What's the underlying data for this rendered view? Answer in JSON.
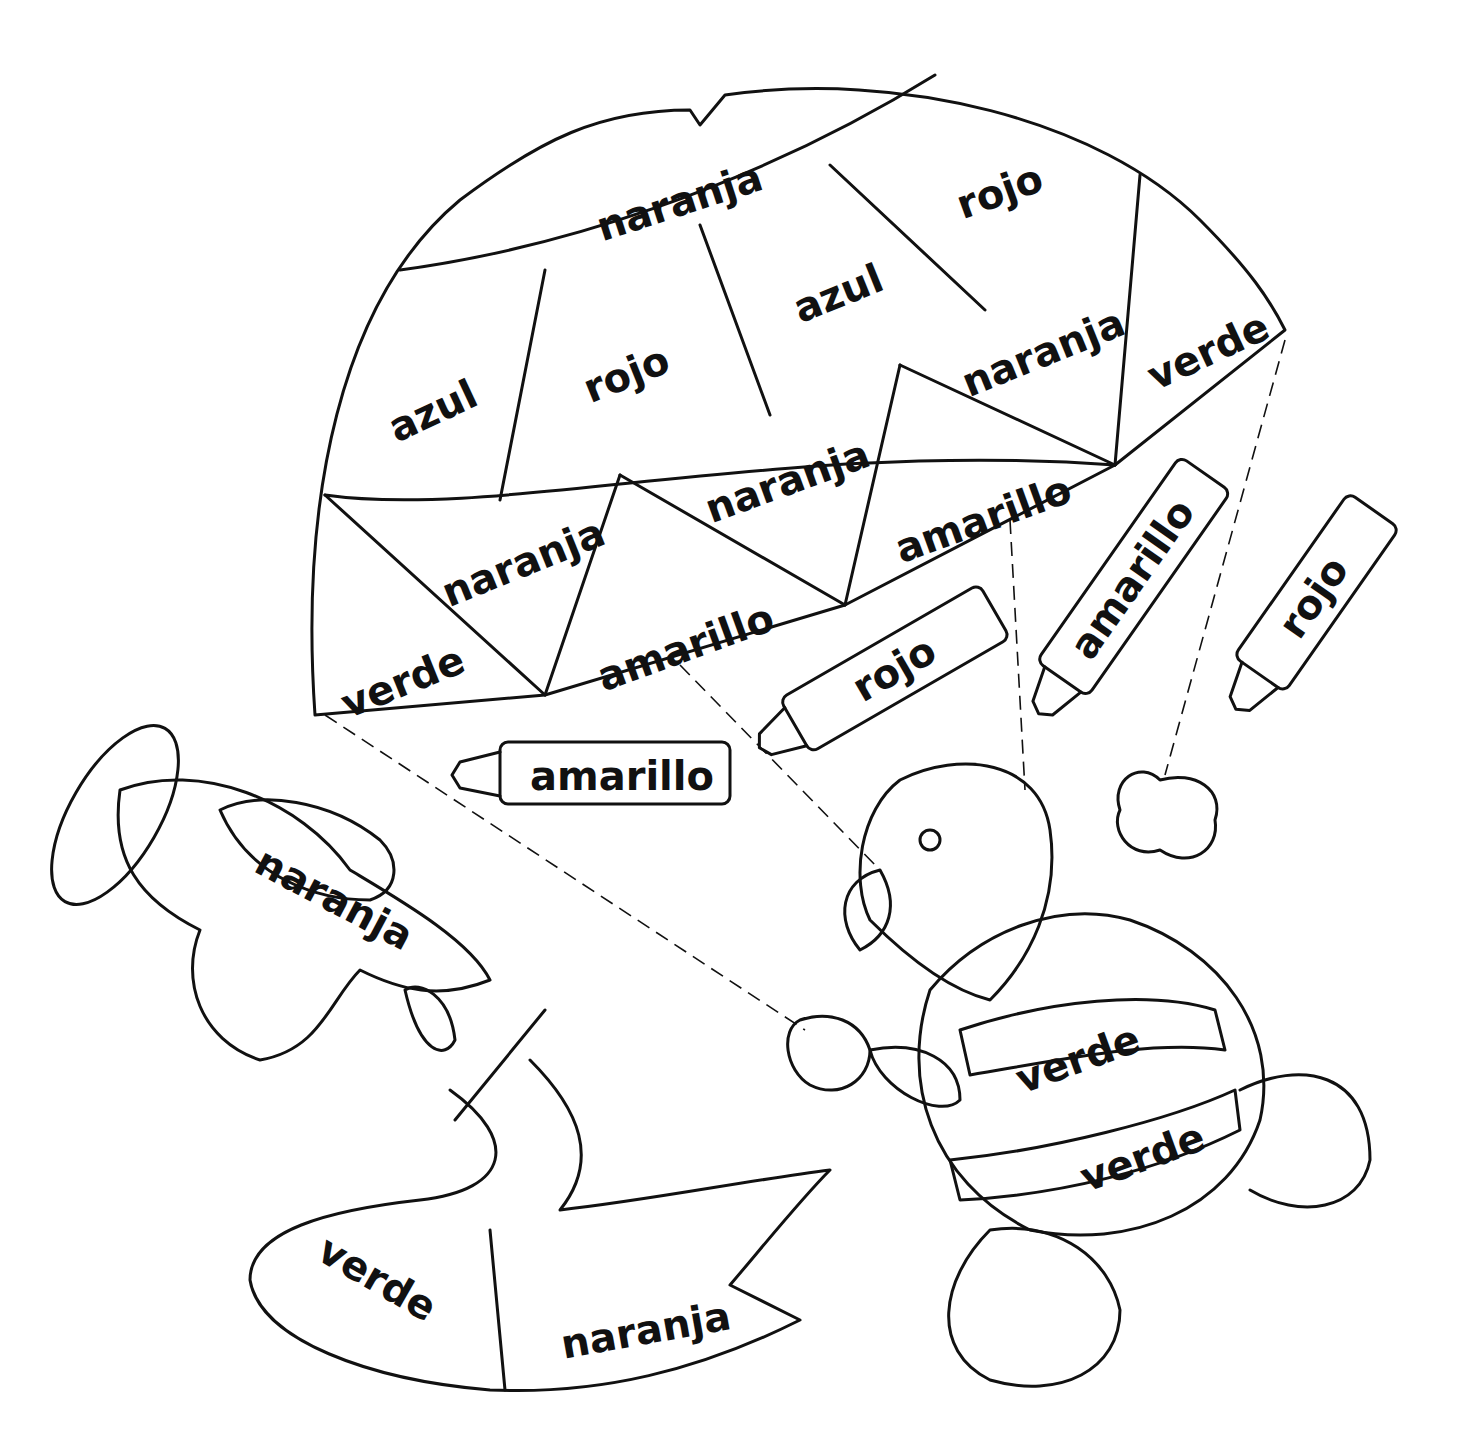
{
  "parachute": {
    "labels": [
      "naranja",
      "rojo",
      "azul",
      "rojo",
      "azul",
      "naranja",
      "verde",
      "naranja",
      "amarillo",
      "naranja",
      "verde",
      "amarillo"
    ]
  },
  "crayons": [
    "amarillo",
    "rojo",
    "amarillo",
    "rojo"
  ],
  "airplane": {
    "label": "naranja"
  },
  "banner": {
    "labels": [
      "verde",
      "naranja"
    ]
  },
  "turtle": {
    "labels": [
      "verde",
      "verde"
    ]
  }
}
